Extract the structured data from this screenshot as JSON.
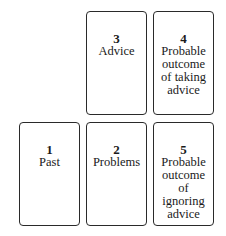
{
  "cards": [
    {
      "number": "1",
      "label": "Past"
    },
    {
      "number": "2",
      "label": "Problems"
    },
    {
      "number": "3",
      "label": "Advice"
    },
    {
      "number": "4",
      "label": "Probable outcome of taking advice"
    },
    {
      "number": "5",
      "label": "Probable outcome of ignoring advice"
    }
  ]
}
